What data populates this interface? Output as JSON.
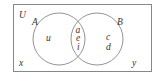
{
  "diagram": {
    "type": "venn",
    "universe_label": "U",
    "sets": [
      {
        "name": "A",
        "only": [
          "u"
        ]
      },
      {
        "name": "B",
        "only": [
          "c",
          "d"
        ]
      }
    ],
    "intersection": [
      "a",
      "e",
      "i"
    ],
    "outside": [
      "x",
      "y"
    ]
  }
}
